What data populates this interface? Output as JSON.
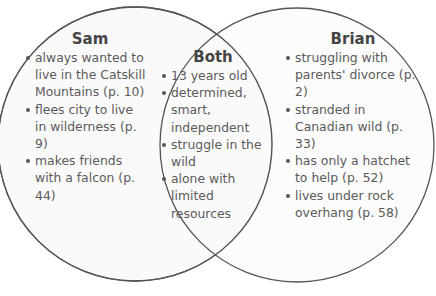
{
  "colors": {
    "background": "#ffffff",
    "circle_fill": "#fafafa",
    "circle_stroke": "#555555",
    "text": "#5a5a5a",
    "heading": "#454545"
  },
  "diagram": {
    "type": "venn",
    "left": {
      "title": "Sam",
      "items": [
        "always wanted to live in the Catskill Mountains (p. 10)",
        "flees city to live in wilderness (p. 9)",
        "makes friends with a falcon (p. 44)"
      ]
    },
    "overlap": {
      "title": "Both",
      "items": [
        "13 years old",
        "determined, smart, independent",
        "struggle in the wild",
        "alone with limited resources"
      ]
    },
    "right": {
      "title": "Brian",
      "items": [
        "struggling with parents' divorce (p. 2)",
        "stranded in Canadian wild (p. 33)",
        "has only a hatchet to help (p. 52)",
        "lives under rock overhang (p. 58)"
      ]
    }
  }
}
